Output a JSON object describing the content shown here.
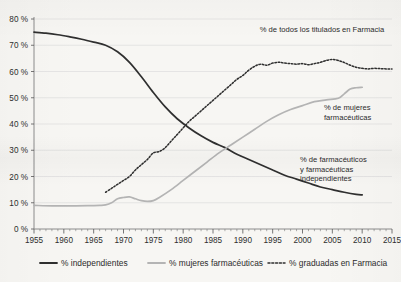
{
  "chart_data": {
    "type": "line",
    "title": "",
    "subtitle": "",
    "xlabel": "",
    "ylabel": "",
    "xlim": [
      1955,
      2015
    ],
    "ylim": [
      0,
      80
    ],
    "grid": true,
    "legend_position": "bottom",
    "y_ticks": [
      "0 %",
      "10 %",
      "20 %",
      "30 %",
      "40 %",
      "50 %",
      "60 %",
      "70 %",
      "80 %"
    ],
    "y_tick_values": [
      0,
      10,
      20,
      30,
      40,
      50,
      60,
      70,
      80
    ],
    "x_ticks": [
      "1955",
      "1960",
      "1965",
      "1970",
      "1975",
      "1980",
      "1985",
      "1990",
      "1995",
      "2000",
      "2005",
      "2010",
      "2015"
    ],
    "x_tick_values": [
      1955,
      1960,
      1965,
      1970,
      1975,
      1980,
      1985,
      1990,
      1995,
      2000,
      2005,
      2010,
      2015
    ],
    "x_minor_step": 1,
    "series": [
      {
        "name": "% independientes",
        "style": "solid",
        "color": "#2f2f2f",
        "x": [
          1955,
          1957,
          1959,
          1961,
          1963,
          1965,
          1967,
          1969,
          1971,
          1973,
          1975,
          1977,
          1979,
          1981,
          1983,
          1985,
          1987,
          1989,
          1991,
          1993,
          1995,
          1997,
          1999,
          2001,
          2003,
          2005,
          2007,
          2009,
          2010
        ],
        "values": [
          75,
          74.6,
          74,
          73.2,
          72.3,
          71.2,
          70,
          67.5,
          63.5,
          58,
          52,
          46.5,
          42,
          38.5,
          35.5,
          33,
          31,
          28.5,
          26.5,
          24.5,
          22.5,
          20.5,
          19,
          17.5,
          16,
          15,
          14,
          13.2,
          13
        ]
      },
      {
        "name": "% mujeres farmacéuticas",
        "style": "solid",
        "color": "#b4b4b4",
        "x": [
          1955,
          1958,
          1961,
          1964,
          1966,
          1967,
          1968,
          1969,
          1970,
          1971,
          1972,
          1973,
          1974,
          1975,
          1976,
          1978,
          1980,
          1982,
          1984,
          1986,
          1988,
          1990,
          1992,
          1994,
          1996,
          1998,
          2000,
          2002,
          2004,
          2006,
          2007,
          2008,
          2009,
          2010
        ],
        "values": [
          9,
          8.8,
          8.8,
          8.9,
          9,
          9.2,
          10,
          11.5,
          12,
          12.2,
          11.5,
          10.8,
          10.5,
          10.8,
          12,
          15,
          18.5,
          22,
          25.5,
          29,
          32,
          35,
          38,
          41,
          43.5,
          45.5,
          47,
          48.5,
          49.2,
          49.8,
          51.5,
          53.3,
          53.8,
          54
        ]
      },
      {
        "name": "% graduadas en Farmacia",
        "style": "dotted",
        "color": "#2f2f2f",
        "x": [
          1967,
          1968,
          1969,
          1970,
          1971,
          1972,
          1973,
          1974,
          1975,
          1976,
          1977,
          1978,
          1979,
          1980,
          1981,
          1982,
          1983,
          1984,
          1985,
          1986,
          1987,
          1988,
          1989,
          1990,
          1991,
          1992,
          1993,
          1994,
          1995,
          1996,
          1997,
          1998,
          1999,
          2000,
          2001,
          2002,
          2003,
          2004,
          2005,
          2006,
          2007,
          2008,
          2009,
          2010,
          2011,
          2012,
          2013,
          2014,
          2015
        ],
        "values": [
          14,
          15.5,
          17,
          18.5,
          20,
          22.5,
          24.5,
          26.5,
          29,
          29.5,
          31,
          33.5,
          36,
          38.5,
          41,
          43,
          45,
          47,
          49,
          51,
          53,
          55,
          57,
          58.5,
          60.5,
          62,
          62.8,
          62.4,
          63.2,
          63.5,
          63.2,
          63,
          62.8,
          63,
          62.6,
          63,
          63.5,
          64.2,
          64.6,
          64.2,
          63.4,
          62.4,
          61.6,
          61.2,
          61,
          61.2,
          61.1,
          61,
          61
        ]
      }
    ],
    "annotations": [
      {
        "id": "annotation-graduadas",
        "lines": [
          "% de todos los titulados en Farmacia"
        ],
        "x_px": 322,
        "y_px": 32,
        "anchor": "middle"
      },
      {
        "id": "annotation-mujeres",
        "lines": [
          "% de mujeres",
          "farmacéuticas"
        ],
        "x_px": 324,
        "y_px": 110,
        "anchor": "start"
      },
      {
        "id": "annotation-independientes",
        "lines": [
          "% de farmacéuticos",
          "y farmacéuticas",
          "independientes"
        ],
        "x_px": 300,
        "y_px": 162,
        "anchor": "start"
      }
    ],
    "legend": [
      {
        "label": "% independientes",
        "style": "solid",
        "color": "#2f2f2f"
      },
      {
        "label": "% mujeres farmacéuticas",
        "style": "solid",
        "color": "#b4b4b4"
      },
      {
        "label": "% graduadas en Farmacia",
        "style": "dotted",
        "color": "#2f2f2f"
      }
    ]
  }
}
